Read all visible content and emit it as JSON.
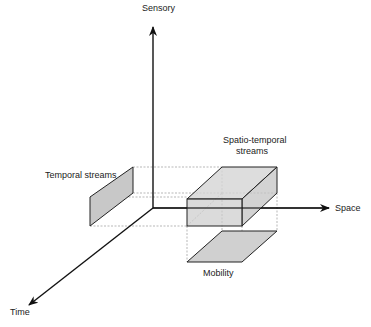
{
  "axes": {
    "sensory": "Sensory",
    "space": "Space",
    "time": "Time"
  },
  "regions": {
    "temporal": "Temporal streams",
    "spatiotemporal_line1": "Spatio-temporal",
    "spatiotemporal_line2": "streams",
    "mobility": "Mobility"
  },
  "colors": {
    "fill": "#c8c8c8",
    "stroke": "#222222",
    "dashed": "#888888"
  }
}
